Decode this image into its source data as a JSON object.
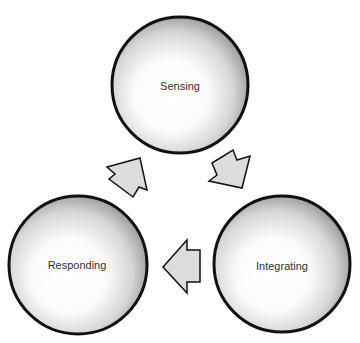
{
  "diagram": {
    "type": "cycle",
    "nodes": [
      {
        "id": "sensing",
        "label": "Sensing"
      },
      {
        "id": "integrating",
        "label": "Integrating"
      },
      {
        "id": "responding",
        "label": "Responding"
      }
    ],
    "edges": [
      {
        "from": "sensing",
        "to": "integrating"
      },
      {
        "from": "integrating",
        "to": "responding"
      },
      {
        "from": "responding",
        "to": "sensing"
      }
    ],
    "colors": {
      "circle_border": "#111111",
      "circle_center": "#ffffff",
      "circle_edge": "#9a9a9a",
      "arrow_fill": "#dcdcdc",
      "arrow_stroke": "#111111",
      "text": "#333333"
    }
  }
}
